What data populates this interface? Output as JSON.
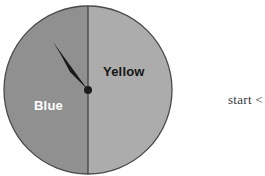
{
  "canvas": {
    "width": 265,
    "height": 176,
    "background": "#ffffff"
  },
  "spinner": {
    "title": "two-sector spinner wheel",
    "center": {
      "x": 88,
      "y": 90
    },
    "radius": 84,
    "outline_color": "#4a4a4a",
    "divider_color": "#3d3d3d",
    "hub_color": "#1c1c1c",
    "hub_radius": 4,
    "pointer": {
      "name": "spinner-needle",
      "color": "#1a1a1a",
      "tip": {
        "x": 53,
        "y": 42
      },
      "angle_degrees": 215,
      "points_to": "Blue"
    },
    "sectors": [
      {
        "label": "Blue",
        "label_color": "#ffffff",
        "fill": "#8c8c8c",
        "side": "left",
        "sweep_degrees": 180
      },
      {
        "label": "Yellow",
        "label_color": "#151515",
        "fill": "#a9a9a9",
        "side": "right",
        "sweep_degrees": 180
      }
    ]
  },
  "annotation": {
    "start_text": "start <"
  }
}
